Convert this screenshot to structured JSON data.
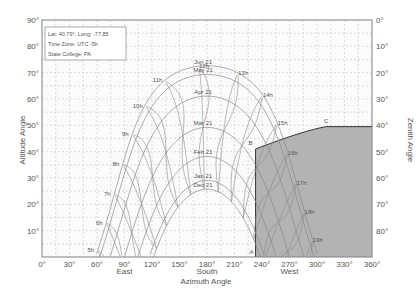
{
  "chart_data": {
    "type": "line",
    "title": "",
    "xlabel": "Azimuth Angle",
    "ylabel": "Altitude Angle",
    "y2label": "Zenith Angle",
    "xlim": [
      0,
      360
    ],
    "ylim": [
      0,
      90
    ],
    "grid": true,
    "x_ticks": [
      "0°",
      "30°",
      "60°",
      "90°",
      "120°",
      "150°",
      "180°",
      "210°",
      "240°",
      "270°",
      "300°",
      "330°",
      "360°"
    ],
    "x_tick_values": [
      0,
      30,
      60,
      90,
      120,
      150,
      180,
      210,
      240,
      270,
      300,
      330,
      360
    ],
    "x_direction_labels": [
      {
        "label": "East",
        "x": 90
      },
      {
        "label": "South",
        "x": 180
      },
      {
        "label": "West",
        "x": 270
      }
    ],
    "y_ticks": [
      "10°",
      "20°",
      "30°",
      "40°",
      "50°",
      "60°",
      "70°",
      "80°",
      "90°"
    ],
    "y_tick_values": [
      10,
      20,
      30,
      40,
      50,
      60,
      70,
      80,
      90
    ],
    "y2_ticks": [
      "0°",
      "10°",
      "20°",
      "30°",
      "40°",
      "50°",
      "60°",
      "70°",
      "80°"
    ],
    "info_box": {
      "line1": "Lat: 40.79°, Long: -77.85",
      "line2": "Time Zone: UTC -5h",
      "line3": "State College, PA"
    },
    "latitude": 40.79,
    "date_series": [
      {
        "name": "Jun 21",
        "declination": 23.44,
        "peak_altitude": 72.6
      },
      {
        "name": "May 21",
        "declination": 20.1,
        "peak_altitude": 69.3
      },
      {
        "name": "Apr 21",
        "declination": 11.9,
        "peak_altitude": 61.1
      },
      {
        "name": "Mar 21",
        "declination": 0.0,
        "peak_altitude": 49.2
      },
      {
        "name": "Feb 21",
        "declination": -11.0,
        "peak_altitude": 38.2
      },
      {
        "name": "Jan 21",
        "declination": -20.1,
        "peak_altitude": 29.1
      },
      {
        "name": "Dec 21",
        "declination": -23.44,
        "peak_altitude": 25.8
      }
    ],
    "hour_labels": [
      "5h",
      "6h",
      "7h",
      "8h",
      "9h",
      "10h",
      "11h",
      "12h",
      "13h",
      "14h",
      "15h",
      "16h",
      "17h",
      "18h",
      "19h"
    ],
    "obstruction": {
      "fill": "#b3b3b3",
      "points": [
        {
          "label": "A",
          "azimuth": 233,
          "altitude": 0
        },
        {
          "label": "B",
          "azimuth": 233,
          "altitude": 41
        },
        {
          "label": "C",
          "azimuth": 310,
          "altitude": 49.5
        },
        {
          "label": "",
          "azimuth": 360,
          "altitude": 49.5
        }
      ]
    }
  },
  "colors": {
    "curve": "#8a8a8a",
    "grid": "#c8c8c8",
    "frame": "#808080",
    "shade": "#b3b3b3",
    "obstruction_line": "#333333"
  }
}
